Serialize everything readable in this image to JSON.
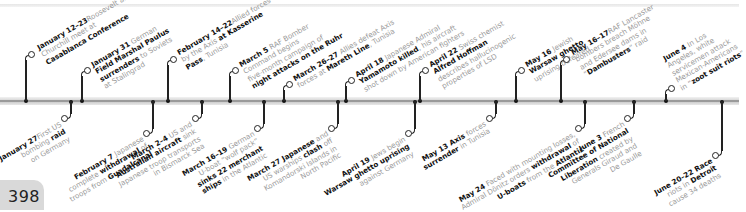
{
  "page": {
    "number": "398"
  },
  "timeline": {
    "above": [
      {
        "id": "jan12",
        "date": "January 12–23",
        "lines": [
          [
            "Roosevelt and"
          ],
          [
            "Churchill meet at"
          ],
          [
            {
              "b": "Casablanca Conference"
            }
          ]
        ],
        "x": 26,
        "circleY": 52,
        "textX": 36,
        "textY": 45
      },
      {
        "id": "jan31",
        "date": "January 31",
        "lines": [
          [
            " German"
          ],
          [
            {
              "b": "Field Marshal Paulus"
            }
          ],
          [
            {
              "b": "surrenders"
            },
            " to Soviets"
          ],
          [
            "at Stalingrad"
          ]
        ],
        "x": 82,
        "circleY": 68,
        "textX": 90,
        "textY": 62
      },
      {
        "id": "feb14",
        "date": "February 14–22",
        "lines": [
          [
            "Allied forces defeated"
          ],
          [
            "by the Axis ",
            {
              "b": "at Kasserine"
            }
          ],
          [
            {
              "b": "Pass"
            },
            ", Tunisia"
          ]
        ],
        "x": 168,
        "circleY": 57,
        "textX": 176,
        "textY": 50
      },
      {
        "id": "mar5",
        "date": "March 5",
        "lines": [
          [
            " RAF Bomber"
          ],
          [
            "Command begins"
          ],
          [
            "five-month campaign of"
          ],
          [
            {
              "b": "night attacks on the Ruhr"
            }
          ]
        ],
        "x": 230,
        "circleY": 68,
        "textX": 238,
        "textY": 62
      },
      {
        "id": "mar26",
        "date": "March 26–27",
        "lines": [
          [
            " Allies defeat Axis"
          ],
          [
            "forces at ",
            {
              "b": "Mareth Line"
            },
            ", Tunisia"
          ]
        ],
        "x": 284,
        "circleY": 82,
        "textX": 292,
        "textY": 76
      },
      {
        "id": "apr18",
        "date": "April 18",
        "lines": [
          [
            " Japanese Admiral"
          ],
          [
            {
              "b": "Yamamoto killed"
            },
            ", his aircraft"
          ],
          [
            "shot down by American fighters"
          ]
        ],
        "x": 346,
        "circleY": 78,
        "textX": 354,
        "textY": 72
      },
      {
        "id": "apr22",
        "date": "April 22",
        "lines": [
          [
            " Swiss chemist"
          ],
          [
            {
              "b": "Alfred Hoffman"
            }
          ],
          [
            "describes hallucinogenic"
          ],
          [
            "properties of LSD"
          ]
        ],
        "x": 420,
        "circleY": 68,
        "textX": 428,
        "textY": 62
      },
      {
        "id": "may16",
        "date": "May 16",
        "lines": [
          [
            " Jewish"
          ],
          [
            {
              "b": "Warsaw ghetto"
            }
          ],
          [
            "uprising defeated"
          ]
        ],
        "x": 516,
        "circleY": 68,
        "textX": 524,
        "textY": 62
      },
      {
        "id": "may1617",
        "date": "May 16–17",
        "lines": [
          [
            "RAF Lancaster"
          ],
          [
            "bombers breach Möhne"
          ],
          [
            "and Edersee dams in"
          ],
          [
            "“",
            {
              "b": "Dambusters"
            },
            "” raid"
          ]
        ],
        "x": 561,
        "circleY": 57,
        "textX": 570,
        "textY": 50
      },
      {
        "id": "jun4",
        "date": "June 4",
        "lines": [
          [
            " In Los"
          ],
          [
            "Angeles, white"
          ],
          [
            "servicemen attack"
          ],
          [
            "Mexican-Americans"
          ],
          [
            "in “",
            {
              "b": "zoot suit riots"
            },
            "”"
          ]
        ],
        "x": 666,
        "circleY": 86,
        "textX": 662,
        "textY": 56
      }
    ],
    "below": [
      {
        "id": "jan27",
        "date": "January 27",
        "lines": [
          [
            "First US"
          ],
          [
            "bombing ",
            {
              "b": "raid"
            }
          ],
          [
            "on Germany"
          ]
        ],
        "x": 71,
        "circleY": 118
      },
      {
        "id": "feb7",
        "date": "February 7",
        "lines": [
          [
            " Japanese"
          ],
          [
            "complete ",
            {
              "b": "withdrawal"
            },
            " of"
          ],
          [
            "troops from ",
            {
              "b": "Guadalcanal"
            }
          ]
        ],
        "x": 153,
        "circleY": 133
      },
      {
        "id": "mar2",
        "date": "March 2–4",
        "lines": [
          [
            " US and"
          ],
          [
            {
              "b": "Australian aircraft"
            },
            " sink"
          ],
          [
            "Japanese troop transports"
          ],
          [
            "in Bismarck Sea"
          ]
        ],
        "x": 202,
        "circleY": 118
      },
      {
        "id": "mar16",
        "date": "March 16–19",
        "lines": [
          [
            " German"
          ],
          [
            "U-boat “wolf pack”"
          ],
          [
            {
              "b": "sinks 22 merchant"
            }
          ],
          [
            {
              "b": "ships"
            },
            " in the Atlantic"
          ]
        ],
        "x": 264,
        "circleY": 128
      },
      {
        "id": "mar27",
        "date": "March 27",
        "lines": [
          [
            {
              "b": " Japanese"
            },
            " and"
          ],
          [
            "US warships ",
            {
              "b": "clash"
            },
            " off"
          ],
          [
            "Komandorski Islands in"
          ],
          [
            "North Pacific"
          ]
        ],
        "x": 338,
        "circleY": 128
      },
      {
        "id": "apr19",
        "date": "April 19",
        "lines": [
          [
            " Jews begin"
          ],
          [
            {
              "b": "Warsaw ghetto uprising"
            }
          ],
          [
            "against Germany"
          ]
        ],
        "x": 415,
        "circleY": 133
      },
      {
        "id": "may13",
        "date": "May 13",
        "lines": [
          [
            {
              "b": " Axis"
            },
            " forces"
          ],
          [
            {
              "b": "surrender"
            },
            " in Tunisia"
          ]
        ],
        "x": 496,
        "circleY": 118
      },
      {
        "id": "may24",
        "date": "May 24",
        "lines": [
          [
            " Faced with mounting losses,"
          ],
          [
            "Admiral Dönitz orders ",
            {
              "b": "withdrawal"
            },
            " of"
          ],
          [
            {
              "b": "U-boats"
            },
            " from the ",
            {
              "b": "Atlantic"
            }
          ]
        ],
        "x": 585,
        "circleY": 128
      },
      {
        "id": "jun3",
        "date": "June 3",
        "lines": [
          [
            " French"
          ],
          [
            {
              "b": "Committee of National"
            }
          ],
          [
            {
              "b": "Liberation"
            },
            " created by"
          ],
          [
            "Generals Giraud and"
          ],
          [
            "De Gaulle"
          ]
        ],
        "x": 634,
        "circleY": 118
      },
      {
        "id": "jun2022",
        "date": "June 20–22",
        "lines": [
          [
            {
              "b": " Race"
            }
          ],
          [
            "riots in ",
            {
              "b": "Detroit"
            }
          ],
          [
            "cause 34 deaths"
          ]
        ],
        "x": 722,
        "circleY": 155
      }
    ],
    "axis_ticks_top": [
      26,
      82,
      168,
      230,
      284,
      346,
      420,
      516,
      561,
      666
    ],
    "axis_ticks_bottom": [
      71,
      153,
      202,
      264,
      338,
      415,
      496,
      585,
      634,
      722
    ]
  }
}
